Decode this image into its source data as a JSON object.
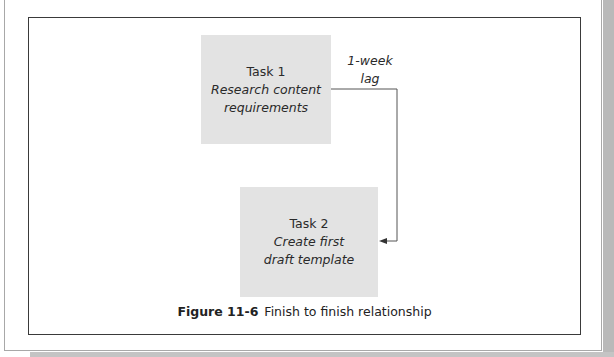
{
  "figure": {
    "tasks": [
      {
        "title": "Task 1",
        "description_line1": "Research content",
        "description_line2": "requirements"
      },
      {
        "title": "Task 2",
        "description_line1": "Create first",
        "description_line2": "draft template"
      }
    ],
    "lag": {
      "line1": "1-week",
      "line2": "lag"
    },
    "relationship": {
      "from": "Task 1",
      "to": "Task 2",
      "type": "finish-to-finish"
    },
    "caption": {
      "label": "Figure 11-6",
      "text": "Finish to finish relationship"
    }
  },
  "colors": {
    "task_box_fill": "#e3e3e3",
    "frame_border": "#3a3a3a",
    "connector": "#555555",
    "page_shadow": "#b9b9b9"
  }
}
